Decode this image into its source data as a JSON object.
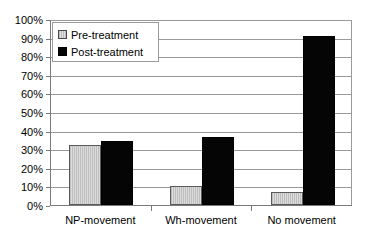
{
  "chart_data": {
    "type": "bar",
    "title": "",
    "xlabel": "",
    "ylabel": "",
    "categories": [
      "NP-movement",
      "Wh-movement",
      "No movement"
    ],
    "series": [
      {
        "name": "Pre-treatment",
        "values": [
          32,
          10,
          7
        ],
        "color": "#c8c8c8"
      },
      {
        "name": "Post-treatment",
        "values": [
          34.5,
          36.5,
          91
        ],
        "color": "#050505"
      }
    ],
    "ylim": [
      0,
      100
    ],
    "ytick_values": [
      0,
      10,
      20,
      30,
      40,
      50,
      60,
      70,
      80,
      90,
      100
    ],
    "ytick_labels": [
      "0%",
      "10%",
      "20%",
      "30%",
      "40%",
      "50%",
      "60%",
      "70%",
      "80%",
      "90%",
      "100%"
    ],
    "grid": true,
    "legend_position": "top-left",
    "legend_entries": [
      "Pre-treatment",
      "Post-treatment"
    ],
    "annotations": []
  }
}
